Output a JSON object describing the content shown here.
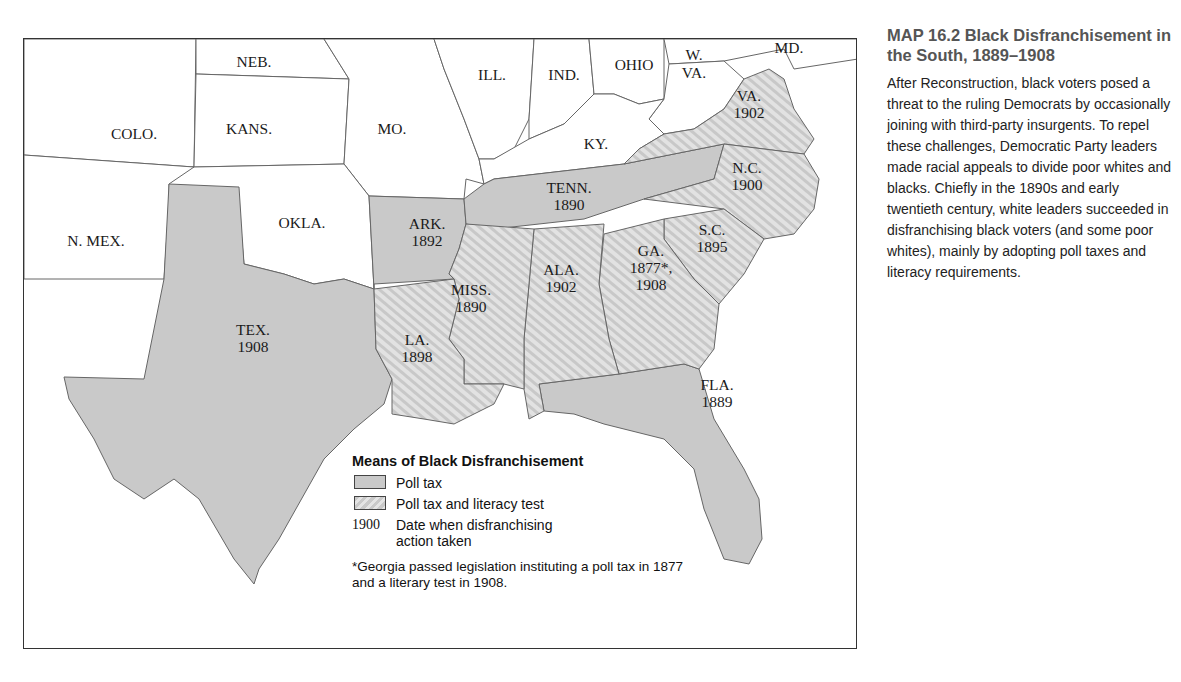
{
  "caption": {
    "title": "MAP 16.2 Black Disfranchisement in the South, 1889–1908",
    "body": "After Reconstruction, black voters posed a threat to the ruling Democrats by occasionally joining with third-party insurgents. To repel these challenges, Democratic Party leaders made racial appeals to divide poor whites and blacks. Chiefly in the 1890s and early twentieth century, white leaders succeeded in disfranchising black voters (and some poor whites), mainly by adopting poll taxes and literacy requirements."
  },
  "colors": {
    "poll_tax_fill": "#c9c9c9",
    "literacy_fill_light": "#e4e4e4",
    "unaffected_fill": "#ffffff",
    "border": "#555555"
  },
  "map": {
    "states": [
      {
        "id": "colo",
        "name": "COLO.",
        "year": "",
        "category": "none"
      },
      {
        "id": "neb",
        "name": "NEB.",
        "year": "",
        "category": "none"
      },
      {
        "id": "kans",
        "name": "KANS.",
        "year": "",
        "category": "none"
      },
      {
        "id": "mo",
        "name": "MO.",
        "year": "",
        "category": "none"
      },
      {
        "id": "ill",
        "name": "ILL.",
        "year": "",
        "category": "none"
      },
      {
        "id": "ind",
        "name": "IND.",
        "year": "",
        "category": "none"
      },
      {
        "id": "ohio",
        "name": "OHIO",
        "year": "",
        "category": "none"
      },
      {
        "id": "md",
        "name": "MD.",
        "year": "",
        "category": "none"
      },
      {
        "id": "wva",
        "name": "W. VA.",
        "year": "",
        "category": "none"
      },
      {
        "id": "ky",
        "name": "KY.",
        "year": "",
        "category": "none"
      },
      {
        "id": "okla",
        "name": "OKLA.",
        "year": "",
        "category": "none"
      },
      {
        "id": "nmex",
        "name": "N. MEX.",
        "year": "",
        "category": "none"
      },
      {
        "id": "va",
        "name": "VA.",
        "year": "1902",
        "category": "poll_tax_literacy"
      },
      {
        "id": "nc",
        "name": "N.C.",
        "year": "1900",
        "category": "poll_tax_literacy"
      },
      {
        "id": "tenn",
        "name": "TENN.",
        "year": "1890",
        "category": "poll_tax"
      },
      {
        "id": "ark",
        "name": "ARK.",
        "year": "1892",
        "category": "poll_tax"
      },
      {
        "id": "sc",
        "name": "S.C.",
        "year": "1895",
        "category": "poll_tax_literacy"
      },
      {
        "id": "ga",
        "name": "GA.",
        "year": "1877*, 1908",
        "category": "poll_tax_literacy"
      },
      {
        "id": "ala",
        "name": "ALA.",
        "year": "1902",
        "category": "poll_tax_literacy"
      },
      {
        "id": "miss",
        "name": "MISS.",
        "year": "1890",
        "category": "poll_tax_literacy"
      },
      {
        "id": "la",
        "name": "LA.",
        "year": "1898",
        "category": "poll_tax_literacy"
      },
      {
        "id": "tex",
        "name": "TEX.",
        "year": "1908",
        "category": "poll_tax"
      },
      {
        "id": "fla",
        "name": "FLA.",
        "year": "1889",
        "category": "poll_tax"
      }
    ]
  },
  "legend": {
    "title": "Means of Black Disfranchisement",
    "items": [
      {
        "swatch": "poll_tax",
        "label": "Poll tax"
      },
      {
        "swatch": "poll_tax_literacy",
        "label": "Poll tax and literacy test"
      },
      {
        "year": "1900",
        "label": "Date when disfranchising action taken"
      }
    ],
    "footnote": "*Georgia passed legislation instituting a poll tax in 1877 and a literary test in 1908."
  }
}
